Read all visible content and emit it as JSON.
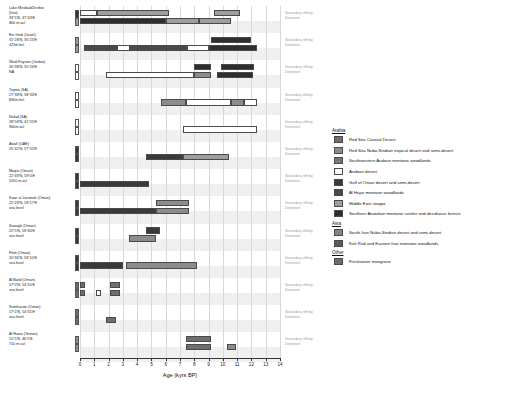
{
  "chart_data": {
    "type": "bar",
    "title": "",
    "xlabel": "Age (kyrs BP)",
    "ylabel": "",
    "xlim": [
      0,
      14
    ],
    "xticks": [
      0,
      1,
      2,
      3,
      4,
      5,
      6,
      7,
      8,
      9,
      10,
      11,
      12,
      13,
      14
    ],
    "grid": true,
    "legend_position": "right",
    "row_track_labels": [
      "Secondary affinity",
      "Dominant"
    ],
    "biome_colors": {
      "red_sea_coastal_desert": "#6e6e6e",
      "red_sea_nubo_sindian": "#8c8c8c",
      "southwestern_arabian_montane": "#777777",
      "arabian_desert": "#ffffff",
      "gulf_of_oman_desert": "#3a3a3a",
      "al_hajar_montane": "#4a4a4a",
      "middle_east_steppe": "#9e9e9e",
      "southern_anatolian_conifer": "#2e2e2e",
      "south_iran_nubo_sindian": "#858585",
      "kuh_rud_eastern_iran_montane": "#5a5a5a",
      "freshwater_mangrove": "#6e6e6e"
    },
    "sites": [
      {
        "name": "Lake Mirabad/Zeribar",
        "country": "(Iran)",
        "coords": "33°5'N, 47°43'E",
        "elevation": "800 m asl",
        "swatches": [
          "#2e2e2e",
          "#9e9e9e"
        ],
        "dominant": [
          {
            "start": 0.0,
            "end": 6.0,
            "color": "#2e2e2e"
          },
          {
            "start": 6.0,
            "end": 8.3,
            "color": "#9e9e9e"
          },
          {
            "start": 8.3,
            "end": 10.6,
            "color": "#9e9e9e"
          }
        ],
        "secondary": [
          {
            "start": 0.0,
            "end": 1.2,
            "color": "#ffffff"
          },
          {
            "start": 1.2,
            "end": 6.2,
            "color": "#9e9e9e"
          },
          {
            "start": 9.4,
            "end": 11.2,
            "color": "#9e9e9e"
          }
        ]
      },
      {
        "name": "Ein Gedi (Israel)",
        "country": "",
        "coords": "31°28'N, 35°23'E",
        "elevation": "423m bsl",
        "swatches": [
          "#9e9e9e",
          "#9e9e9e"
        ],
        "dominant": [
          {
            "start": 0.3,
            "end": 2.6,
            "color": "#4a4a4a"
          },
          {
            "start": 2.6,
            "end": 3.5,
            "color": "#ffffff"
          },
          {
            "start": 3.5,
            "end": 7.5,
            "color": "#4a4a4a"
          },
          {
            "start": 7.5,
            "end": 9.0,
            "color": "#ffffff"
          },
          {
            "start": 9.0,
            "end": 12.4,
            "color": "#2e2e2e"
          }
        ],
        "secondary": [
          {
            "start": 9.2,
            "end": 12.0,
            "color": "#2e2e2e"
          }
        ]
      },
      {
        "name": "Wadi Faynan (Jordan)",
        "country": "",
        "coords": "30°38'N, 35°26'E",
        "elevation": "NA",
        "swatches": [
          "#ffffff",
          "#ffffff"
        ],
        "dominant": [
          {
            "start": 1.8,
            "end": 8.0,
            "color": "#ffffff"
          },
          {
            "start": 8.0,
            "end": 9.2,
            "color": "#8c8c8c"
          },
          {
            "start": 9.6,
            "end": 12.1,
            "color": "#2e2e2e"
          }
        ],
        "secondary": [
          {
            "start": 8.0,
            "end": 9.2,
            "color": "#2e2e2e"
          },
          {
            "start": 9.9,
            "end": 12.2,
            "color": "#2e2e2e"
          }
        ]
      },
      {
        "name": "Tayma (SA)",
        "country": "",
        "coords": "27°38'N, 38°33'E",
        "elevation": "830m bsl",
        "swatches": [
          "#ffffff",
          "#ffffff"
        ],
        "dominant": [
          {
            "start": 5.7,
            "end": 7.4,
            "color": "#8c8c8c"
          },
          {
            "start": 7.4,
            "end": 10.6,
            "color": "#ffffff"
          },
          {
            "start": 10.6,
            "end": 11.5,
            "color": "#8c8c8c"
          },
          {
            "start": 11.5,
            "end": 12.4,
            "color": "#ffffff"
          }
        ],
        "secondary": []
      },
      {
        "name": "Nafud (SA)",
        "country": "",
        "coords": "28°58'N, 41°55'E",
        "elevation": "900m asl",
        "swatches": [
          "#ffffff",
          "#ffffff"
        ],
        "dominant": [
          {
            "start": 7.2,
            "end": 12.4,
            "color": "#ffffff"
          }
        ],
        "secondary": []
      },
      {
        "name": "Awafi (UAE)",
        "country": "",
        "coords": "25°42'N, 57°55'E",
        "elevation": "",
        "swatches": [
          "#3a3a3a",
          "#3a3a3a"
        ],
        "dominant": [
          {
            "start": 4.6,
            "end": 7.2,
            "color": "#3a3a3a"
          },
          {
            "start": 7.2,
            "end": 10.4,
            "color": "#9e9e9e"
          }
        ],
        "secondary": []
      },
      {
        "name": "Maqta (Oman)",
        "country": "",
        "coords": "22°49'N, 59°0'E",
        "elevation": "1050 m asl",
        "swatches": [
          "#3a3a3a",
          "#3a3a3a"
        ],
        "dominant": [
          {
            "start": 0.0,
            "end": 4.8,
            "color": "#3a3a3a"
          }
        ],
        "secondary": []
      },
      {
        "name": "Kwar al Jaramah (Oman)",
        "country": "",
        "coords": "22°29'N, 58°17'E",
        "elevation": "sea level",
        "swatches": [
          "#3a3a3a",
          "#3a3a3a"
        ],
        "dominant": [
          {
            "start": 0.0,
            "end": 5.3,
            "color": "#3a3a3a"
          },
          {
            "start": 5.3,
            "end": 7.6,
            "color": "#8c8c8c"
          }
        ],
        "secondary": [
          {
            "start": 5.3,
            "end": 7.6,
            "color": "#8c8c8c"
          }
        ]
      },
      {
        "name": "Suwayh (Oman)",
        "country": "",
        "coords": "22°5'N, 59°40'E",
        "elevation": "sea level",
        "swatches": [
          "#3a3a3a",
          "#3a3a3a"
        ],
        "dominant": [
          {
            "start": 3.4,
            "end": 5.3,
            "color": "#8c8c8c"
          }
        ],
        "secondary": [
          {
            "start": 4.6,
            "end": 5.6,
            "color": "#3a3a3a"
          }
        ]
      },
      {
        "name": "Filim (Oman)",
        "country": "",
        "coords": "20°36'N, 58°10'E",
        "elevation": "sea level",
        "swatches": [
          "#3a3a3a",
          "#3a3a3a"
        ],
        "dominant": [
          {
            "start": 0.0,
            "end": 3.0,
            "color": "#3a3a3a"
          },
          {
            "start": 3.2,
            "end": 8.2,
            "color": "#8c8c8c"
          }
        ],
        "secondary": []
      },
      {
        "name": "Al Balid (Oman)",
        "country": "",
        "coords": "17°0'N, 54°10'E",
        "elevation": "sea level",
        "swatches": [
          "#6e6e6e",
          "#6e6e6e"
        ],
        "dominant": [
          {
            "start": 0.0,
            "end": 0.35,
            "color": "#6e6e6e"
          },
          {
            "start": 1.1,
            "end": 1.5,
            "color": "#ffffff"
          },
          {
            "start": 2.1,
            "end": 2.8,
            "color": "#6e6e6e"
          }
        ],
        "secondary": [
          {
            "start": 0.0,
            "end": 0.35,
            "color": "#6e6e6e"
          },
          {
            "start": 2.1,
            "end": 2.8,
            "color": "#6e6e6e"
          }
        ]
      },
      {
        "name": "Sumharam (Oman)",
        "country": "",
        "coords": "17°2'N, 54°31'E",
        "elevation": "sea level",
        "swatches": [
          "#6e6e6e",
          "#6e6e6e"
        ],
        "dominant": [
          {
            "start": 1.8,
            "end": 2.5,
            "color": "#6e6e6e"
          }
        ],
        "secondary": []
      },
      {
        "name": "Al Hawa (Yemen)",
        "country": "",
        "coords": "15°5'N, 46°5'E",
        "elevation": "710 m asl",
        "swatches": [
          "#8c8c8c",
          "#8c8c8c"
        ],
        "dominant": [
          {
            "start": 7.4,
            "end": 9.2,
            "color": "#6e6e6e"
          },
          {
            "start": 10.3,
            "end": 10.9,
            "color": "#8c8c8c"
          }
        ],
        "secondary": [
          {
            "start": 7.4,
            "end": 9.2,
            "color": "#6e6e6e"
          }
        ]
      }
    ]
  },
  "legend": {
    "groups": [
      {
        "title": "Arabia",
        "items": [
          {
            "label": "Red Sea Coastal Desert",
            "color": "#6e6e6e"
          },
          {
            "label": "Red Sea Nubo-Sindian tropical desert and semi-desert",
            "color": "#8c8c8c"
          },
          {
            "label": "Southwestern Arabian montane woodlands",
            "color": "#777777"
          },
          {
            "label": "Arabian desert",
            "color": "#ffffff"
          },
          {
            "label": "Gulf of Oman desert and semi-desert",
            "color": "#3a3a3a"
          },
          {
            "label": "Al Hajar montane woodlands",
            "color": "#4a4a4a"
          },
          {
            "label": "Middle East steppe",
            "color": "#9e9e9e"
          },
          {
            "label": "Southern Anatolian montane conifer and deciduous forests",
            "color": "#2e2e2e"
          }
        ]
      },
      {
        "title": "Asia",
        "items": [
          {
            "label": "South Iran Nubo-Sindian desert and semi-desert",
            "color": "#858585"
          },
          {
            "label": "Kuh Rud and Eastern Iran montane woodlands",
            "color": "#5a5a5a"
          }
        ]
      },
      {
        "title": "Other",
        "items": [
          {
            "label": "Freshwater mangrove",
            "color": "#6e6e6e"
          }
        ]
      }
    ]
  }
}
